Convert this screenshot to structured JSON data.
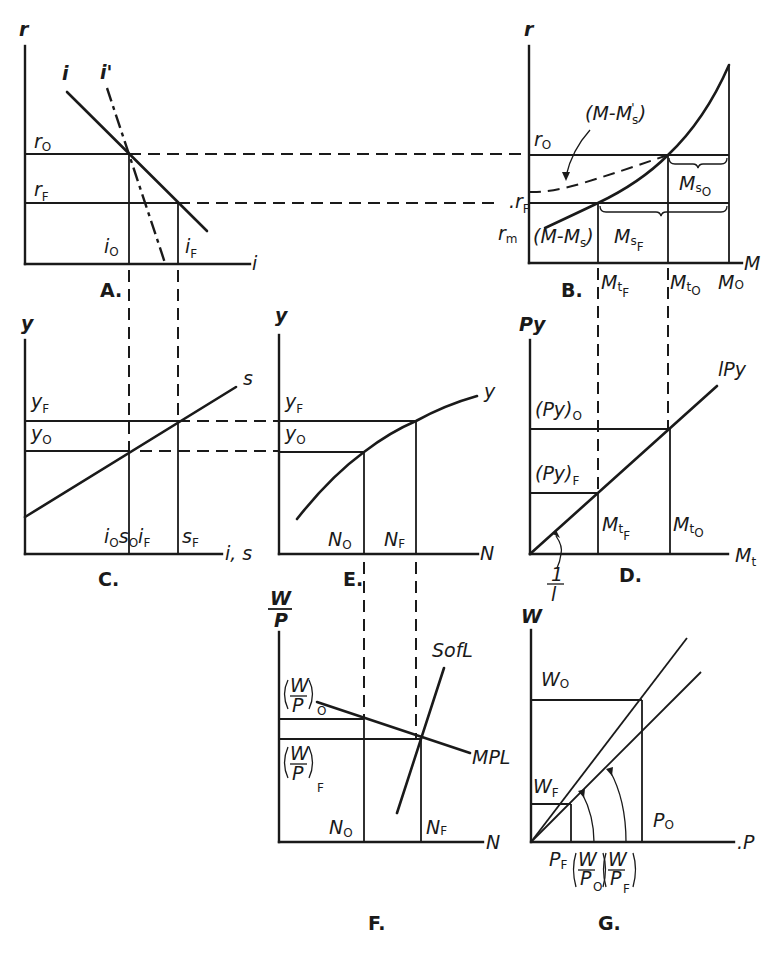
{
  "figure": {
    "panels": [
      {
        "id": "A",
        "label": "A.",
        "x_axis": "i",
        "y_axis": "r",
        "curves": [
          "i",
          "i'"
        ],
        "levels_y": [
          "r_O",
          "r_F"
        ],
        "levels_x": [
          "i_O",
          "i_F"
        ]
      },
      {
        "id": "B",
        "label": "B.",
        "x_axis": "M",
        "y_axis": "r",
        "curves": [
          "(M-M_s)",
          "(M-M'_s)"
        ],
        "levels_y": [
          "r_O",
          "r_F",
          "r_m"
        ],
        "levels_x": [
          "Mt_F",
          "Mt_O",
          "M_O"
        ],
        "braces": [
          "M_sO",
          "M_sF"
        ]
      },
      {
        "id": "C",
        "label": "C.",
        "x_axis": "i, s",
        "y_axis": "y",
        "curves": [
          "s"
        ],
        "levels_y": [
          "y_F",
          "y_O"
        ],
        "levels_x": [
          "i_O s_O",
          "i_F s_F"
        ]
      },
      {
        "id": "D",
        "label": "D.",
        "x_axis": "M_t",
        "y_axis": "Py",
        "curves": [
          "lPy"
        ],
        "levels_y": [
          "(Py)_O",
          "(Py)_F"
        ],
        "levels_x": [
          "Mt_F",
          "Mt_O"
        ],
        "slope_label": "1/l"
      },
      {
        "id": "E",
        "label": "E.",
        "x_axis": "N",
        "y_axis": "y",
        "curves": [
          "y"
        ],
        "levels_y": [
          "y_F",
          "y_O"
        ],
        "levels_x": [
          "N_O",
          "N_F"
        ]
      },
      {
        "id": "F",
        "label": "F.",
        "x_axis": "N",
        "y_axis": "W/P",
        "curves": [
          "SofL",
          "MPL"
        ],
        "levels_y": [
          "(W/P)_O",
          "(W/P)_F"
        ],
        "levels_x": [
          "N_O",
          "N_F"
        ]
      },
      {
        "id": "G",
        "label": "G.",
        "x_axis": "P",
        "y_axis": "W",
        "curves": [
          "(W/P)_O",
          "(W/P)_F"
        ],
        "levels_y": [
          "W_O",
          "W_F"
        ],
        "levels_x": [
          "P_F",
          "P_O"
        ]
      }
    ]
  },
  "labels": {
    "A": {
      "panel": "A.",
      "yaxis": "r",
      "xaxis": "i",
      "curve1": "i",
      "curve2": "i'",
      "r": "r",
      "o": "O",
      "f": "F",
      "i": "i"
    },
    "B": {
      "panel": "B.",
      "yaxis": "r",
      "xaxis": "M",
      "r": "r",
      "o": "O",
      "f": "F",
      "m": "m",
      "dashed_curve": "(M-M",
      "dashed_curve_sub": "s",
      "dashed_curve_sup": "'",
      "close": ")",
      "solid_curve": "(M-M",
      "solid_curve_sub": "s",
      "M": "M",
      "t": "t",
      "s": "s",
      "Mo": "M"
    },
    "C": {
      "panel": "C.",
      "yaxis": "y",
      "xaxis": "i, s",
      "curve": "s",
      "y": "y",
      "o": "O",
      "f": "F",
      "i": "i",
      "s": "s"
    },
    "D": {
      "panel": "D.",
      "yaxis": "Py",
      "xaxis_main": "M",
      "xaxis_sub": "t",
      "curve": "lPy",
      "py": "(Py)",
      "o": "O",
      "f": "F",
      "M": "M",
      "t": "t",
      "one": "1",
      "l": "l"
    },
    "E": {
      "panel": "E.",
      "yaxis": "y",
      "xaxis": "N",
      "curve": "y",
      "y": "y",
      "o": "O",
      "f": "F",
      "N": "N"
    },
    "F": {
      "panel": "F.",
      "yaxis_num": "W",
      "yaxis_den": "P",
      "xaxis": "N",
      "sofl": "SofL",
      "mpl": "MPL",
      "W": "W",
      "P": "P",
      "o": "O",
      "f": "F",
      "N": "N"
    },
    "G": {
      "panel": "G.",
      "yaxis": "W",
      "xaxis": "P",
      "W": "W",
      "P": "P",
      "o": "O",
      "f": "F"
    }
  }
}
